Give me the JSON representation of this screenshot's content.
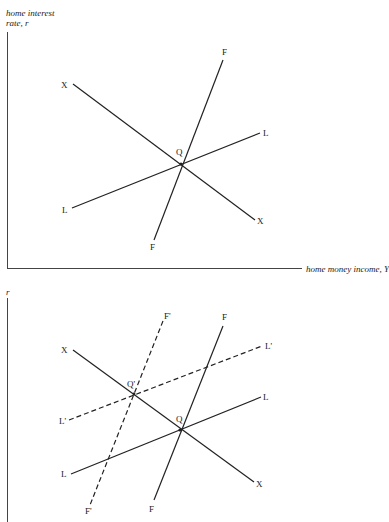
{
  "top_diagram": {
    "y_axis_label_line1": "home interest",
    "y_axis_label_line2": "rate, r",
    "x_axis_label": "home money income, Y",
    "curves": [
      {
        "name": "XX",
        "style": "solid",
        "label_start": "X",
        "label_end": "X"
      },
      {
        "name": "FF",
        "style": "solid",
        "label_start": "F",
        "label_end": "F"
      },
      {
        "name": "LL",
        "style": "solid",
        "label_start": "L",
        "label_end": "L"
      }
    ],
    "intersection_label": "Q"
  },
  "bottom_diagram": {
    "y_axis_label": "r",
    "curves": [
      {
        "name": "XX",
        "style": "solid",
        "label_start": "X",
        "label_end": "X"
      },
      {
        "name": "FF",
        "style": "solid",
        "label_start": "F",
        "label_end": "F"
      },
      {
        "name": "LL",
        "style": "solid",
        "label_start": "L",
        "label_end": "L"
      },
      {
        "name": "F'F'",
        "style": "dashed",
        "label_start": "F'",
        "label_end": "F'"
      },
      {
        "name": "L'L'",
        "style": "dashed",
        "label_start": "L'",
        "label_end": "L'"
      }
    ],
    "intersection_labels": [
      "Q'",
      "Q"
    ]
  },
  "colors": {
    "line": "#222222",
    "background": "#ffffff"
  }
}
